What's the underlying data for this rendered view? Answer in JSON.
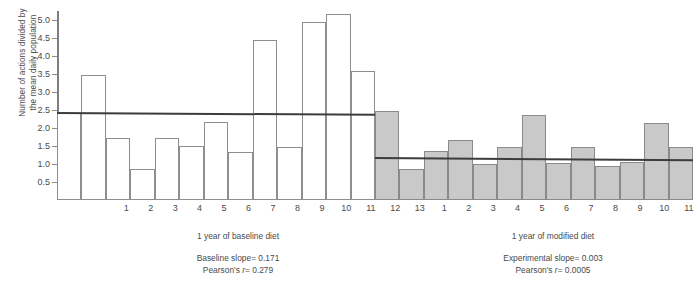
{
  "chart_data": {
    "type": "bar",
    "title": "",
    "ylabel": "Number of actions divided by the mean daily population",
    "ylabel_line1": "Number of actions divided by",
    "ylabel_line2": "the mean daily population",
    "ylim": [
      0,
      5.25
    ],
    "yticks": [
      0.5,
      1.0,
      1.5,
      2.0,
      2.5,
      3.0,
      3.5,
      4.0,
      4.5,
      5.0
    ],
    "ytick_labels": [
      "0.5",
      "1.0",
      "1.5",
      "2.0",
      "2.5",
      "3.0",
      "3.5",
      "4.0",
      "4.5",
      "5.0"
    ],
    "grid": false,
    "legend": "none",
    "categories": [
      "1",
      "2",
      "3",
      "4",
      "5",
      "6",
      "7",
      "8",
      "9",
      "10",
      "11",
      "12",
      "13"
    ],
    "series": [
      {
        "name": "1 year of baseline diet",
        "style": "open",
        "xlabel": "1 year of baseline diet",
        "values": [
          2.43,
          3.46,
          1.72,
          0.86,
          1.72,
          1.5,
          2.18,
          1.32,
          4.44,
          1.48,
          4.95,
          5.18,
          3.58
        ],
        "trend": {
          "label": "Baseline slope= 0.171",
          "slope": 0.171,
          "y_start": 2.45,
          "y_end": 2.4
        },
        "stats": {
          "slope_label": "Baseline slope= 0.171",
          "pearson_label": "Pearson's r= 0.279",
          "slope": 0.171,
          "pearson_r": 0.279
        }
      },
      {
        "name": "1 year of modified diet",
        "style": "filled",
        "xlabel": "1 year of modified diet",
        "values": [
          2.46,
          0.86,
          1.35,
          1.68,
          1.0,
          1.48,
          2.35,
          1.03,
          1.48,
          0.95,
          1.05,
          2.14,
          1.47
        ],
        "trend": {
          "label": "Experimental slope= 0.003",
          "slope": 0.003,
          "y_start": 1.19,
          "y_end": 1.13
        },
        "stats": {
          "slope_label": "Experimental slope= 0.003",
          "pearson_label": "Pearson's r= 0.0005",
          "slope": 0.003,
          "pearson_r": 0.0005
        }
      }
    ],
    "colors": {
      "open_bar_fill": "#ffffff",
      "filled_bar_fill": "#c9c9c9",
      "bar_stroke": "#8e8e8e",
      "trend_line": "#3c3c3c",
      "axis": "#7d7d7d",
      "text": "#4a4a4a"
    }
  },
  "captions": {
    "baseline_axis": "1 year of baseline diet",
    "modified_axis": "1 year of modified diet",
    "baseline_slope": "Baseline slope= 0.171",
    "baseline_pearson_prefix": "Pearson's ",
    "baseline_pearson_italic": "r",
    "baseline_pearson_value": "= 0.279",
    "modified_slope": "Experimental slope= 0.003",
    "modified_pearson_prefix": "Pearson's ",
    "modified_pearson_italic": "r",
    "modified_pearson_value": "= 0.0005"
  }
}
